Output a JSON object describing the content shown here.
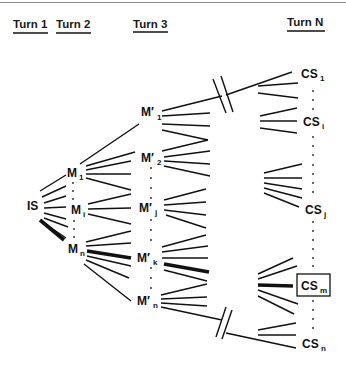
{
  "headers": {
    "turn1": "Turn 1",
    "turn2": "Turn 2",
    "turn3": "Turn 3",
    "turnN": "Turn N"
  },
  "nodes": {
    "initial": {
      "main": "IS"
    },
    "turn2": [
      {
        "main": "M",
        "sub": "1"
      },
      {
        "main": "M",
        "sub": "i"
      },
      {
        "main": "M",
        "sub": "n"
      }
    ],
    "turn3": [
      {
        "main": "M′",
        "sub": "1"
      },
      {
        "main": "M′",
        "sub": "2"
      },
      {
        "main": "M′",
        "sub": "j"
      },
      {
        "main": "M′",
        "sub": "k"
      },
      {
        "main": "M′",
        "sub": "n"
      }
    ],
    "turnN": [
      {
        "main": "CS",
        "sub": "1"
      },
      {
        "main": "CS",
        "sub": "i"
      },
      {
        "main": "CS",
        "sub": "j"
      },
      {
        "main": "CS",
        "sub": "m",
        "boxed": true
      },
      {
        "main": "CS",
        "sub": "n"
      }
    ]
  },
  "highlighted_path": [
    "IS",
    "Mn",
    "M′k",
    "CSm"
  ],
  "colors": {
    "line": "#111111",
    "background": "#ffffff"
  }
}
